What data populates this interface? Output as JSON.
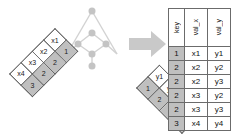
{
  "diagram": {
    "type": "join-illustration",
    "background_color": "#ffffff",
    "key_cell_color": "#bfbfbf",
    "value_cell_color": "#ffffff",
    "border_color": "#5a5a5a",
    "graph_color": "#c9c9c9",
    "arrow_color": "#c9c9c9"
  },
  "left_table": {
    "name": "x",
    "columns": [
      "val_x",
      "key"
    ],
    "rows": [
      {
        "val_x": "x1",
        "key": "1"
      },
      {
        "val_x": "x2",
        "key": "2"
      },
      {
        "val_x": "x3",
        "key": "2"
      },
      {
        "val_x": "x4",
        "key": "3"
      }
    ]
  },
  "right_table": {
    "name": "y",
    "columns": [
      "key",
      "val_y"
    ],
    "rows": [
      {
        "key": "1",
        "val_y": "y1"
      },
      {
        "key": "2",
        "val_y": "y2"
      },
      {
        "key": "2",
        "val_y": "y3"
      },
      {
        "key": "3",
        "val_y": "y4"
      }
    ]
  },
  "arrow": {
    "icon": "arrow-right-icon",
    "label": "produces"
  },
  "result_table": {
    "headers": [
      "key",
      "val_x",
      "val_y"
    ],
    "rows": [
      {
        "key": "1",
        "val_x": "x1",
        "val_y": "y1"
      },
      {
        "key": "2",
        "val_x": "x2",
        "val_y": "y2"
      },
      {
        "key": "2",
        "val_x": "x2",
        "val_y": "y3"
      },
      {
        "key": "2",
        "val_x": "x3",
        "val_y": "y2"
      },
      {
        "key": "2",
        "val_x": "x3",
        "val_y": "y3"
      },
      {
        "key": "3",
        "val_x": "x4",
        "val_y": "y4"
      }
    ]
  },
  "match_graph": {
    "description": "key matching lattice connecting left rows to right rows",
    "node_count": 7
  }
}
